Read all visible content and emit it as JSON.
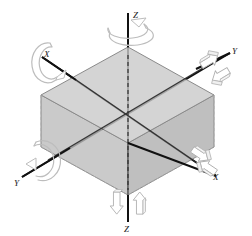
{
  "figure": {
    "type": "isometric-3d-axes-diagram",
    "background_color": "#ffffff"
  },
  "colors": {
    "axis_line": "#111111",
    "box_top_face": "#c9c9c9",
    "box_left_face": "#bdbdbd",
    "box_right_face": "#b3b3b3",
    "box_edge": "#6e6e6e",
    "box_hidden_edge": "#a0a0a0",
    "arrow_outline": "#b5b5b5",
    "arrow_fill": "#ffffff",
    "label_text": "#1a1a1a"
  },
  "box": {
    "name": "rigid-body-box",
    "top_vertices": [
      [
        128,
        47
      ],
      [
        214,
        95
      ],
      [
        128,
        143
      ],
      [
        41,
        95
      ]
    ],
    "depth_px": 52
  },
  "axes": [
    {
      "id": "z",
      "label": "Z",
      "orientation": "vertical",
      "line": {
        "x1": 128,
        "y1": 13,
        "x2": 128,
        "y2": 222
      },
      "labels": [
        {
          "text": "Z",
          "x": 134,
          "y": 17,
          "position": "top"
        },
        {
          "text": "Z",
          "x": 131,
          "y": 232,
          "position": "bottom"
        }
      ],
      "rotation_arrow": {
        "type": "ellipse-circular",
        "cx": 125,
        "cy": 30,
        "position": "top"
      },
      "translation_arrows": [
        {
          "direction": "down",
          "x": 116,
          "y": 196
        },
        {
          "direction": "up",
          "x": 140,
          "y": 196
        }
      ]
    },
    {
      "id": "x",
      "label": "X",
      "orientation": "diagonal-upper-left-to-lower-right",
      "line": {
        "x1": 42,
        "y1": 57,
        "x2": 216,
        "y2": 176
      },
      "labels": [
        {
          "text": "X",
          "x": 45,
          "y": 56,
          "position": "upper-left"
        },
        {
          "text": "X",
          "x": 216,
          "y": 176,
          "position": "lower-right"
        }
      ],
      "rotation_arrow": {
        "type": "c-shape",
        "cx": 43,
        "cy": 64,
        "position": "upper-left"
      },
      "translation_arrows": [
        {
          "direction": "lower-right",
          "x": 213,
          "y": 152
        },
        {
          "direction": "upper-left",
          "x": 192,
          "y": 172
        }
      ]
    },
    {
      "id": "y",
      "label": "Y",
      "orientation": "diagonal-lower-left-to-upper-right",
      "line": {
        "x1": 22,
        "y1": 177,
        "x2": 230,
        "y2": 53
      },
      "labels": [
        {
          "text": "Y",
          "x": 16,
          "y": 184,
          "position": "lower-left"
        },
        {
          "text": "Y",
          "x": 232,
          "y": 52,
          "position": "upper-right"
        }
      ],
      "rotation_arrow": {
        "type": "c-shape-reversed",
        "cx": 40,
        "cy": 165,
        "position": "lower-left"
      },
      "translation_arrows": [
        {
          "direction": "upper-right",
          "x": 213,
          "y": 57
        },
        {
          "direction": "lower-left",
          "x": 222,
          "y": 73
        }
      ]
    }
  ],
  "legend": {
    "rotation_arrows_count": 3,
    "translation_arrows_count": 6,
    "degrees_of_freedom": 6
  }
}
